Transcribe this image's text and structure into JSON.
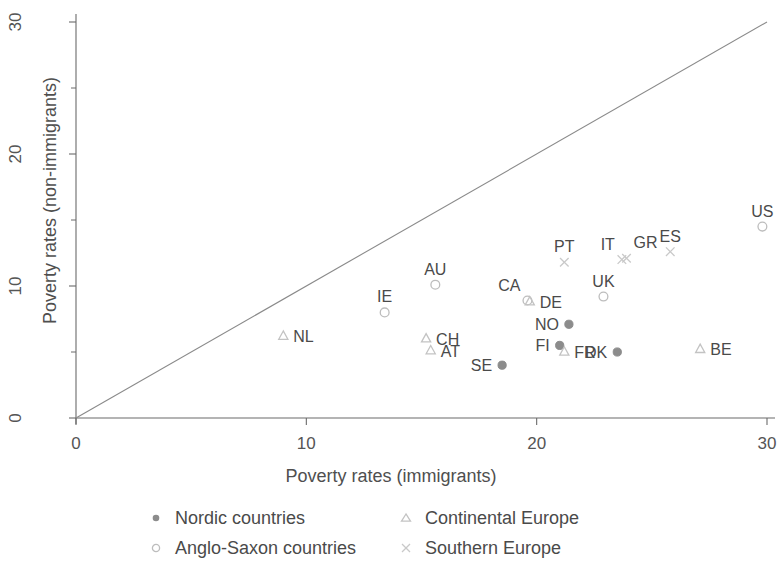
{
  "chart_data": {
    "type": "scatter",
    "title": "",
    "xlabel": "Poverty rates (immigrants)",
    "ylabel": "Poverty rates (non-immigrants)",
    "xlim": [
      0,
      30
    ],
    "ylim": [
      0,
      30
    ],
    "xticks": [
      0,
      10,
      20,
      30
    ],
    "yticks": [
      0,
      10,
      20,
      30
    ],
    "xtick_labels": [
      "0",
      "10",
      "20",
      "30"
    ],
    "ytick_labels": [
      "0",
      "10",
      "20",
      "30"
    ],
    "grid": false,
    "legend_position": "bottom",
    "reference_line": {
      "type": "identity",
      "from": [
        0,
        0
      ],
      "to": [
        30,
        30
      ]
    },
    "series": [
      {
        "name": "Nordic countries",
        "marker": "filled-circle",
        "color": "#8c8c8c",
        "points": [
          {
            "label": "NO",
            "x": 21.4,
            "y": 7.1,
            "label_pos": "left"
          },
          {
            "label": "FI",
            "x": 21.0,
            "y": 5.5,
            "label_pos": "left"
          },
          {
            "label": "DK",
            "x": 23.5,
            "y": 5.0,
            "label_pos": "left"
          },
          {
            "label": "SE",
            "x": 18.5,
            "y": 4.0,
            "label_pos": "left"
          }
        ]
      },
      {
        "name": "Anglo-Saxon countries",
        "marker": "open-circle",
        "color": "#bdbdbd",
        "points": [
          {
            "label": "US",
            "x": 29.8,
            "y": 14.5,
            "label_pos": "above"
          },
          {
            "label": "CA",
            "x": 19.6,
            "y": 8.9,
            "label_pos": "above-left"
          },
          {
            "label": "UK",
            "x": 22.9,
            "y": 9.2,
            "label_pos": "above"
          },
          {
            "label": "AU",
            "x": 15.6,
            "y": 10.1,
            "label_pos": "above"
          },
          {
            "label": "IE",
            "x": 13.4,
            "y": 8.0,
            "label_pos": "above"
          }
        ]
      },
      {
        "name": "Continental Europe",
        "marker": "triangle",
        "color": "#c3c3c3",
        "points": [
          {
            "label": "NL",
            "x": 9.0,
            "y": 6.2,
            "label_pos": "right"
          },
          {
            "label": "CH",
            "x": 15.2,
            "y": 6.0,
            "label_pos": "right"
          },
          {
            "label": "AT",
            "x": 15.4,
            "y": 5.1,
            "label_pos": "right"
          },
          {
            "label": "DE",
            "x": 19.7,
            "y": 8.8,
            "label_pos": "right"
          },
          {
            "label": "FR",
            "x": 21.2,
            "y": 5.0,
            "label_pos": "right"
          },
          {
            "label": "BE",
            "x": 27.1,
            "y": 5.2,
            "label_pos": "right"
          }
        ]
      },
      {
        "name": "Southern Europe",
        "marker": "cross",
        "color": "#c9c9c9",
        "points": [
          {
            "label": "PT",
            "x": 21.2,
            "y": 11.8,
            "label_pos": "above"
          },
          {
            "label": "IT",
            "x": 23.7,
            "y": 12.0,
            "label_pos": "above-left"
          },
          {
            "label": "GR",
            "x": 23.9,
            "y": 12.1,
            "label_pos": "above-right"
          },
          {
            "label": "ES",
            "x": 25.8,
            "y": 12.6,
            "label_pos": "above"
          }
        ]
      }
    ]
  },
  "legend": {
    "entries": [
      {
        "label": "Nordic countries",
        "marker": "filled-circle"
      },
      {
        "label": "Continental Europe",
        "marker": "triangle"
      },
      {
        "label": "Anglo-Saxon countries",
        "marker": "open-circle"
      },
      {
        "label": "Southern Europe",
        "marker": "cross"
      }
    ]
  },
  "colors": {
    "axis": "#6b6b6b",
    "text": "#4a4a4a",
    "nordic": "#8c8c8c",
    "anglo": "#bdbdbd",
    "continental": "#c3c3c3",
    "southern": "#c9c9c9",
    "reference_line": "#8a8a8a"
  }
}
